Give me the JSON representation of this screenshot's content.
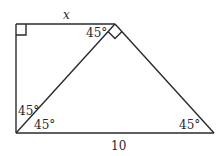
{
  "diagram": {
    "labels": {
      "top_side": "x",
      "bottom_side": "10",
      "angle_apex_left": "45°",
      "angle_bottom_left_upper": "45°",
      "angle_bottom_left_lower": "45°",
      "angle_bottom_right": "45°"
    },
    "markers": {
      "top_left_corner": "right-angle",
      "apex": "right-angle"
    },
    "colors": {
      "stroke": "#2a2a2a",
      "background": "#ffffff"
    }
  }
}
